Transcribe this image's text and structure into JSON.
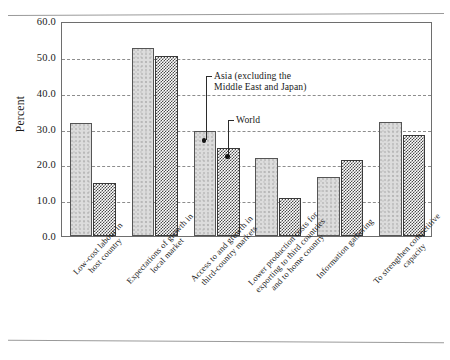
{
  "chart_data": {
    "type": "bar",
    "title": "",
    "subtitle": "",
    "xlabel": "",
    "ylabel": "Percent",
    "ylim": [
      0.0,
      60.0
    ],
    "ytick_step": 10.0,
    "ytick_labels": [
      "60.0",
      "50.0",
      "40.0",
      "30.0",
      "20.0",
      "10.0",
      "0.0"
    ],
    "ytick_values": [
      60.0,
      50.0,
      40.0,
      30.0,
      20.0,
      10.0,
      0.0
    ],
    "grid": "horizontal-dashed",
    "legend_position": "inline-annotations",
    "categories": [
      "Low-cost labour in\nhost country",
      "Expectations of growth in\nlocal market",
      "Access to and growth in\nthird-country markets",
      "Lower production costs for\nexporting to third countries\nand to home country",
      "Information gathering",
      "To strengthen competitive\ncapacity"
    ],
    "series": [
      {
        "name": "Asia (excluding the\nMiddle East and Japan)",
        "key": "asia",
        "values": [
          31.5,
          52.5,
          29.2,
          21.8,
          16.5,
          31.7
        ]
      },
      {
        "name": "World",
        "key": "world",
        "values": [
          14.8,
          50.3,
          24.7,
          10.7,
          21.3,
          28.2
        ]
      }
    ],
    "annotations": [
      {
        "label": "Asia (excluding the\nMiddle East and Japan)",
        "target_category_index": 2,
        "target_series": "asia",
        "target_value": 29.2
      },
      {
        "label": "World",
        "target_category_index": 2,
        "target_series": "world",
        "target_value": 24.7
      }
    ]
  },
  "colors": {
    "asia_fill": "#dcdcdc",
    "world_fill": "#4a4a4a",
    "frame": "#6e6e6e",
    "grid": "#8d8d8d",
    "text": "#1a1a1a",
    "background": "#ffffff"
  }
}
